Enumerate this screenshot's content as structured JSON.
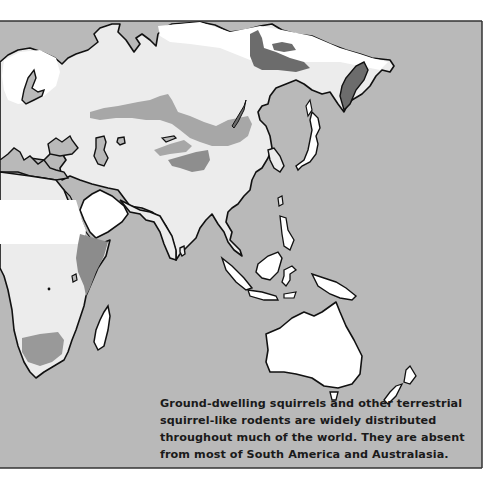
{
  "map": {
    "colors": {
      "ocean": "#b9b9b9",
      "land_range": "#ececec",
      "land_absent": "#ffffff",
      "species_medium": "#a7a7a7",
      "species_dark": "#6c6c6c",
      "water_body": "#b9b9b9",
      "coastline": "#111111",
      "frame": "#333333"
    },
    "regions": [
      "Europe",
      "Asia",
      "Africa",
      "Southeast Asia",
      "Australia",
      "New Zealand"
    ]
  },
  "caption": {
    "lines": [
      "Ground-dwelling squirrels and other terrestrial",
      "squirrel-like rodents are widely distributed",
      "throughout much of the world. They are absent",
      "from most of South America and Australasia."
    ]
  }
}
